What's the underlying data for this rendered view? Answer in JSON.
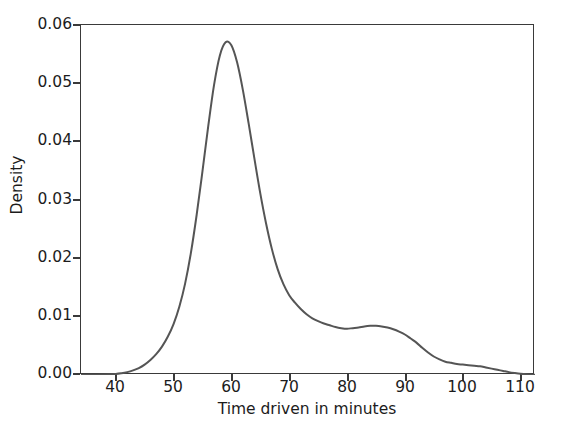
{
  "chart_data": {
    "type": "line",
    "title": "",
    "subtitle": "",
    "xlabel": "Time driven in minutes",
    "ylabel": "Density",
    "xlim": [
      34.0,
      112.5
    ],
    "ylim": [
      0.0,
      0.0605
    ],
    "xticks": [
      40,
      50,
      60,
      70,
      80,
      90,
      100,
      110
    ],
    "xtick_labels": [
      "40",
      "50",
      "60",
      "70",
      "80",
      "90",
      "100",
      "110"
    ],
    "yticks": [
      0.0,
      0.01,
      0.02,
      0.03,
      0.04,
      0.05,
      0.06
    ],
    "ytick_labels": [
      "0.00",
      "0.01",
      "0.02",
      "0.03",
      "0.04",
      "0.05",
      "0.06"
    ],
    "grid": false,
    "legend": null,
    "annotations": [],
    "line_color": "#555555",
    "line_width": 2.0,
    "series": [
      {
        "name": "Density",
        "x": [
          34.0,
          36.0,
          38.0,
          40.0,
          41.0,
          42.0,
          43.0,
          44.0,
          45.0,
          46.0,
          47.0,
          48.0,
          49.0,
          50.0,
          51.0,
          52.0,
          53.0,
          54.0,
          55.0,
          56.0,
          57.0,
          58.0,
          59.0,
          60.0,
          61.0,
          62.0,
          63.0,
          64.0,
          65.0,
          66.0,
          67.0,
          68.0,
          69.0,
          70.0,
          71.0,
          72.0,
          73.0,
          74.0,
          75.0,
          76.0,
          77.0,
          78.0,
          79.0,
          80.0,
          81.0,
          82.0,
          83.0,
          84.0,
          85.0,
          86.0,
          87.0,
          88.0,
          89.0,
          90.0,
          91.0,
          92.0,
          93.0,
          94.0,
          95.0,
          96.0,
          97.0,
          98.0,
          99.0,
          100.0,
          101.0,
          102.0,
          103.0,
          104.0,
          105.0,
          106.0,
          107.0,
          108.0,
          109.0,
          110.0,
          111.0,
          112.5
        ],
        "y": [
          2e-05,
          4e-05,
          8e-05,
          0.00018,
          0.0003,
          0.0005,
          0.0008,
          0.0012,
          0.0018,
          0.0026,
          0.0036,
          0.0049,
          0.0066,
          0.0088,
          0.0118,
          0.0158,
          0.0211,
          0.0277,
          0.0352,
          0.043,
          0.0501,
          0.0552,
          0.0575,
          0.057,
          0.054,
          0.0492,
          0.0434,
          0.0373,
          0.0314,
          0.0262,
          0.0218,
          0.0183,
          0.0157,
          0.0138,
          0.0125,
          0.0114,
          0.0105,
          0.0098,
          0.0093,
          0.0089,
          0.0086,
          0.0083,
          0.0081,
          0.008,
          0.0081,
          0.0082,
          0.0084,
          0.0085,
          0.0085,
          0.0084,
          0.0082,
          0.0079,
          0.0075,
          0.007,
          0.0063,
          0.0056,
          0.0047,
          0.0039,
          0.0032,
          0.0027,
          0.0023,
          0.0021,
          0.0019,
          0.0018,
          0.0017,
          0.0016,
          0.0015,
          0.0013,
          0.0011,
          0.0009,
          0.0007,
          0.0005,
          0.00035,
          0.00022,
          0.00013,
          6e-05
        ]
      }
    ],
    "peak": {
      "x": 59.0,
      "y": 0.0575
    },
    "secondary_bump": {
      "x": 84.5,
      "y": 0.0085
    }
  }
}
